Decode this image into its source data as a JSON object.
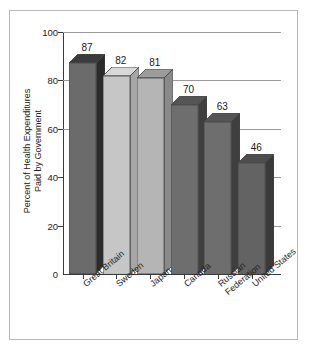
{
  "chart_data": {
    "type": "bar",
    "title": "",
    "subtitle": "",
    "xlabel": "",
    "ylabel": "Percent of Health Expenditures\nPaid by Government",
    "categories": [
      "Great Britain",
      "Sweden",
      "Japan",
      "Canada",
      "Russian\nFederation",
      "United States"
    ],
    "values": [
      87,
      82,
      81,
      70,
      63,
      46
    ],
    "value_labels": [
      "87",
      "82",
      "81",
      "70",
      "63",
      "46"
    ],
    "ylim": [
      0,
      100
    ],
    "ytick_labels": [
      "100",
      "80",
      "60",
      "40",
      "20",
      "0"
    ],
    "ytick_values": [
      100,
      80,
      60,
      40,
      20,
      0
    ],
    "grid": "horizontal gridlines at 100, 80, 60; short right-edge ticks at 40 and 20",
    "legend": "none",
    "bar_style": "3d-extruded",
    "bar_colors": [
      "#6b6b6b",
      "#c6c6c6",
      "#b5b5b5",
      "#6e6e6e",
      "#6e6e6e",
      "#636363"
    ],
    "bar_top_colors": [
      "#3b3b3b",
      "#d8d8d8",
      "#9c9c9c",
      "#555555",
      "#555555",
      "#4d4d4d"
    ],
    "bar_side_colors": [
      "#2b2b2b",
      "#a6a6a6",
      "#8a8a8a",
      "#3f3f3f",
      "#3f3f3f",
      "#3a3a3a"
    ],
    "axis_color": "#3a3a3a",
    "gridline_color": "#9a9a9a",
    "frame_color": "#b9b9b9",
    "background_color": "#ffffff"
  }
}
